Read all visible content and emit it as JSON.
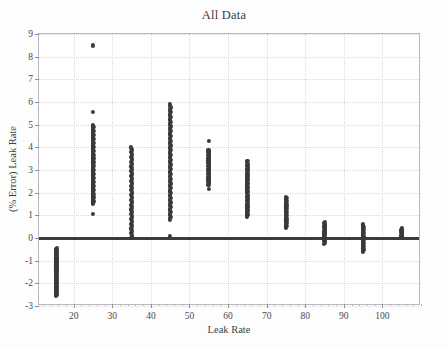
{
  "chart_data": {
    "type": "scatter",
    "title": "All Data",
    "xlabel": "Leak Rate",
    "ylabel": "(% Error) Leak Rate",
    "xlim": [
      11,
      110
    ],
    "ylim": [
      -3,
      9
    ],
    "grid": true,
    "legend": null,
    "marker_color": "#3a3a3a",
    "xticks": [
      20,
      30,
      40,
      50,
      60,
      70,
      80,
      90,
      100
    ],
    "yticks": [
      -3,
      -2,
      -1,
      0,
      1,
      2,
      3,
      4,
      5,
      6,
      7,
      8,
      9
    ],
    "zero_reference_line": 0,
    "groups": [
      {
        "x": 15.5,
        "label": "15",
        "y_min": -2.55,
        "y_max": -0.45,
        "n": 48,
        "outliers": []
      },
      {
        "x": 25,
        "label": "25",
        "y_min": 1.5,
        "y_max": 5.0,
        "n": 62,
        "outliers": [
          8.5,
          5.55,
          1.05
        ]
      },
      {
        "x": 35,
        "label": "35",
        "y_min": 0.0,
        "y_max": 4.0,
        "n": 58,
        "outliers": []
      },
      {
        "x": 45,
        "label": "45",
        "y_min": 0.8,
        "y_max": 5.9,
        "n": 74,
        "outliers": [
          0.1
        ]
      },
      {
        "x": 55,
        "label": "55",
        "y_min": 2.35,
        "y_max": 3.9,
        "n": 40,
        "outliers": [
          4.3,
          2.15
        ]
      },
      {
        "x": 65,
        "label": "65",
        "y_min": 0.95,
        "y_max": 3.4,
        "n": 44,
        "outliers": []
      },
      {
        "x": 75,
        "label": "75",
        "y_min": 0.45,
        "y_max": 1.8,
        "n": 34,
        "outliers": []
      },
      {
        "x": 85,
        "label": "85",
        "y_min": -0.25,
        "y_max": 0.7,
        "n": 26,
        "outliers": []
      },
      {
        "x": 95,
        "label": "95",
        "y_min": -0.6,
        "y_max": 0.6,
        "n": 26,
        "outliers": []
      },
      {
        "x": 105,
        "label": "105",
        "y_min": 0.05,
        "y_max": 0.42,
        "n": 12,
        "outliers": []
      }
    ]
  }
}
